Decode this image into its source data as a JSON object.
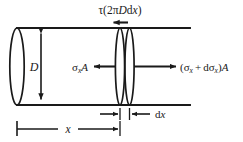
{
  "figure": {
    "type": "engineering-diagram",
    "background_color": "#ffffff",
    "line_color": "#1a1a1a",
    "labels": {
      "shear_force": {
        "tau": "τ",
        "open_paren": "(",
        "coefficient": "2",
        "pi": "π",
        "diameter": "D",
        "differential_d": "d",
        "differential_x": "x",
        "close_paren": ")",
        "full_text": "τ(2πDdx)"
      },
      "left_force": {
        "sigma": "σ",
        "subscript": "x",
        "area": "A",
        "full_text": "σxA"
      },
      "right_force": {
        "open_paren": "(",
        "sigma": "σ",
        "subscript": "x",
        "plus": "+",
        "differential_d": "d",
        "sigma2": "σ",
        "subscript2": "x",
        "close_paren": ")",
        "area": "A",
        "full_text": "(σx + dσx)A"
      },
      "diameter": {
        "symbol": "D",
        "full_text": "D"
      },
      "position": {
        "symbol": "x",
        "full_text": "x"
      },
      "element_width": {
        "differential_d": "d",
        "symbol": "x",
        "full_text": "dx"
      }
    }
  }
}
